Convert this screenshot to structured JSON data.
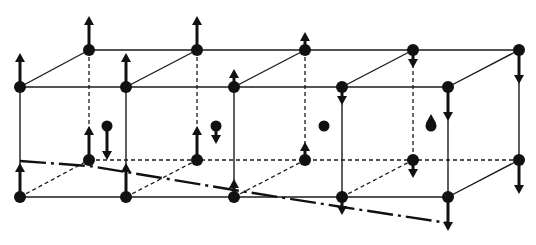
{
  "diagram": {
    "title": "",
    "colors": {
      "line": "#1a1a1a",
      "atom": "#111111",
      "background": "#ffffff"
    },
    "geometry": {
      "front_x": [
        20,
        126,
        234,
        342,
        448
      ],
      "back_x": [
        89,
        197,
        305,
        413,
        519
      ],
      "front_top_y": 87,
      "back_top_y": 50,
      "front_bottom_y": 197,
      "back_bottom_y": 160
    },
    "atoms": {
      "front_top": [
        {
          "x": 20,
          "y": 87,
          "spin": "up"
        },
        {
          "x": 126,
          "y": 87,
          "spin": "up"
        },
        {
          "x": 234,
          "y": 87,
          "spin": "up-short"
        },
        {
          "x": 342,
          "y": 87,
          "spin": "down-short"
        },
        {
          "x": 448,
          "y": 87,
          "spin": "down"
        }
      ],
      "back_top": [
        {
          "x": 89,
          "y": 50,
          "spin": "up"
        },
        {
          "x": 197,
          "y": 50,
          "spin": "up"
        },
        {
          "x": 305,
          "y": 50,
          "spin": "up-short"
        },
        {
          "x": 413,
          "y": 50,
          "spin": "down-short"
        },
        {
          "x": 519,
          "y": 50,
          "spin": "down"
        }
      ],
      "front_bottom": [
        {
          "x": 20,
          "y": 197,
          "spin": "up"
        },
        {
          "x": 126,
          "y": 197,
          "spin": "up"
        },
        {
          "x": 234,
          "y": 197,
          "spin": "up-short"
        },
        {
          "x": 342,
          "y": 197,
          "spin": "down-short"
        },
        {
          "x": 448,
          "y": 197,
          "spin": "down"
        }
      ],
      "back_bottom": [
        {
          "x": 89,
          "y": 160,
          "spin": "up"
        },
        {
          "x": 197,
          "y": 160,
          "spin": "up"
        },
        {
          "x": 305,
          "y": 160,
          "spin": "up-short"
        },
        {
          "x": 413,
          "y": 160,
          "spin": "down-short"
        },
        {
          "x": 519,
          "y": 160,
          "spin": "down"
        }
      ],
      "body_center": [
        {
          "x": 107,
          "y": 126,
          "spin": "down"
        },
        {
          "x": 216,
          "y": 126,
          "spin": "down-short"
        },
        {
          "x": 324,
          "y": 126,
          "spin": "none"
        },
        {
          "x": 431,
          "y": 126,
          "spin": "up-tiny"
        }
      ]
    },
    "cutting_plane": {
      "points": [
        [
          20,
          161
        ],
        [
          89,
          166
        ],
        [
          126,
          172
        ],
        [
          234,
          190
        ],
        [
          342,
          207
        ],
        [
          448,
          223
        ]
      ],
      "style": "dash-dot"
    }
  }
}
